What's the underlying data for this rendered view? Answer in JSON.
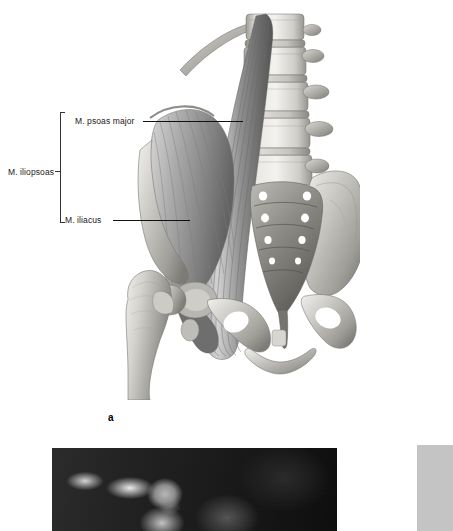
{
  "figure": {
    "letter": "a",
    "type": "anatomical-illustration",
    "style": "grayscale halftone medical illustration"
  },
  "labels": {
    "psoas_major": "M. psoas major",
    "iliacus": "M. iliacus",
    "iliopsoas": "M. iliopsoas"
  },
  "photo": {
    "name": "athlete-photograph",
    "description": "dark blurred sports photograph, partially cropped at page bottom"
  },
  "gray_panel": {
    "name": "side-margin-block",
    "color": "#c4c4c4"
  },
  "colors": {
    "background": "#ffffff",
    "label_text": "#1a1a1a",
    "leader_line": "#111111",
    "bracket": "#333333",
    "bone_light": "#f0efed",
    "bone_mid": "#c9c7c2",
    "bone_dark": "#8d8b86",
    "muscle_light": "#bdbdbd",
    "muscle_dark": "#6e6e6e"
  }
}
